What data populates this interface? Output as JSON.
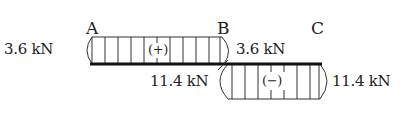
{
  "diagram": {
    "type": "shear-force-diagram",
    "points": [
      {
        "label": "A",
        "x": 92
      },
      {
        "label": "B",
        "x": 224
      },
      {
        "label": "C",
        "x": 320
      }
    ],
    "segments": [
      {
        "from": "A",
        "to": "B",
        "sign_label": "(+)",
        "sign": "positive",
        "value_left": "3.6 kN",
        "value_right": "3.6 kN"
      },
      {
        "from": "B",
        "to": "C",
        "sign_label": "(−)",
        "sign": "negative",
        "value_left": "11.4 kN",
        "value_right": "11.4 kN"
      }
    ],
    "labels": {
      "point_a": "A",
      "point_b": "B",
      "point_c": "C",
      "ab_left_value": "3.6 kN",
      "ab_right_value": "3.6 kN",
      "bc_left_value": "11.4 kN",
      "bc_right_value": "11.4 kN",
      "ab_sign": "(+)",
      "bc_sign": "(−)"
    },
    "colors": {
      "line": "#222222",
      "axis": "#111111",
      "background": "#ffffff"
    }
  }
}
